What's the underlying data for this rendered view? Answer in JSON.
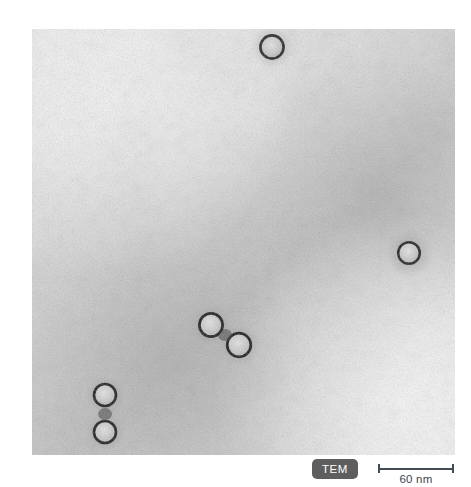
{
  "figure": {
    "kind": "electron-micrograph",
    "background_color": "#ffffff"
  },
  "micrograph": {
    "modality_label": "TEM",
    "alt_description": "Negative-stain transmission electron micrograph showing rounded virus-like particles on a grainy stained background",
    "frame": {
      "x": 32,
      "y": 29,
      "width": 423,
      "height": 426
    },
    "background": {
      "base_color": "#d9d9d9",
      "light_color": "#f2f2f2",
      "dark_color": "#9d9d9d",
      "grain": "fine speckle"
    },
    "particles": [
      {
        "id": "particle-1",
        "cx": 240,
        "cy": 18,
        "r": 12,
        "label": "top-edge particle"
      },
      {
        "id": "particle-2",
        "cx": 377,
        "cy": 224,
        "r": 11,
        "label": "right particle"
      },
      {
        "id": "particle-3",
        "cx": 179,
        "cy": 296,
        "r": 12,
        "label": "center-pair upper-left particle"
      },
      {
        "id": "particle-4",
        "cx": 207,
        "cy": 315,
        "r": 12,
        "label": "center-pair lower-right particle"
      },
      {
        "id": "particle-5",
        "cx": 73,
        "cy": 366,
        "r": 11,
        "label": "bottom-left upper particle"
      },
      {
        "id": "particle-6",
        "cx": 73,
        "cy": 403,
        "r": 11,
        "label": "bottom-left lower particle"
      }
    ],
    "particle_style": {
      "rim_color": "#2a2a2a",
      "core_color": "#cfcfcf",
      "halo_color": "#8a8a8a"
    }
  },
  "scalebar": {
    "label": "60 nm",
    "value": 60,
    "unit": "nm",
    "line_color": "#444b52",
    "length_px": 76
  },
  "badge": {
    "text": "TEM",
    "background_color": "#5e5e5e",
    "text_color": "#ffffff"
  }
}
